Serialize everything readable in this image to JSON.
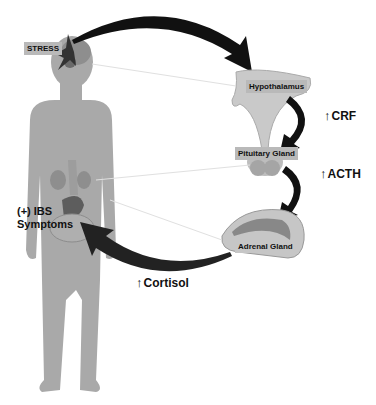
{
  "diagram": {
    "nodes": {
      "stress": "STRESS",
      "hypothalamus": "Hypothalamus",
      "pituitary": "Pituitary Gland",
      "adrenal": "Adrenal Gland",
      "ibs_line1": "(+) IBS",
      "ibs_line2": "Symptoms"
    },
    "hormones": {
      "up_arrow": "↑",
      "crf": "CRF",
      "acth": "ACTH",
      "cortisol": "Cortisol"
    },
    "colors": {
      "body": "#a9a9a9",
      "arrow": "#111111",
      "label_bg": "#b9b9b9",
      "gland": "#c9c9c9"
    }
  }
}
